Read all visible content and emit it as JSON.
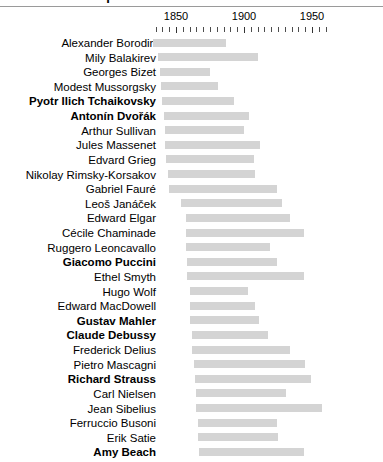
{
  "title": "Composers of the Late Romantic Era",
  "axis": {
    "labels": [
      "1850",
      "1900",
      "1950"
    ],
    "label_years": [
      1850,
      1900,
      1950
    ],
    "tick_step": 5,
    "tick_start": 1835,
    "tick_end": 1960,
    "x_min_year": 1830,
    "x_max_year": 1965,
    "pixels_per_year": 1.36,
    "origin_px": 176
  },
  "colors": {
    "bar": "#d4d4d4",
    "text": "#000000",
    "tick": "#4d4d4d",
    "rule": "#9a9a9a",
    "background": "#ffffff"
  },
  "chart_data": {
    "type": "bar",
    "title": "Composers of the Late Romantic Era",
    "xlabel": "",
    "ylabel": "",
    "xlim": [
      1830,
      1965
    ],
    "grid": false,
    "legend": "none",
    "note": "Horizontal range (Gantt-style) bars: each bar spans the composer's birth year to death year.",
    "categories": [
      "Alexander Borodin",
      "Mily Balakirev",
      "Georges Bizet",
      "Modest Mussorgsky",
      "Pyotr Ilich Tchaikovsky",
      "Antonín Dvořák",
      "Arthur Sullivan",
      "Jules Massenet",
      "Edvard Grieg",
      "Nikolay Rimsky-Korsakov",
      "Gabriel Fauré",
      "Leoš Janáček",
      "Edward Elgar",
      "Cécile Chaminade",
      "Ruggero Leoncavallo",
      "Giacomo Puccini",
      "Ethel Smyth",
      "Hugo Wolf",
      "Edward MacDowell",
      "Gustav Mahler",
      "Claude Debussy",
      "Frederick Delius",
      "Pietro Mascagni",
      "Richard Strauss",
      "Carl Nielsen",
      "Jean Sibelius",
      "Ferruccio Busoni",
      "Erik Satie",
      "Amy Beach"
    ],
    "series": [
      {
        "name": "lifespan",
        "ranges": [
          [
            1833,
            1887
          ],
          [
            1837,
            1910
          ],
          [
            1838,
            1875
          ],
          [
            1839,
            1881
          ],
          [
            1840,
            1893
          ],
          [
            1841,
            1904
          ],
          [
            1842,
            1900
          ],
          [
            1842,
            1912
          ],
          [
            1843,
            1907
          ],
          [
            1844,
            1908
          ],
          [
            1845,
            1924
          ],
          [
            1854,
            1928
          ],
          [
            1857,
            1934
          ],
          [
            1857,
            1944
          ],
          [
            1857,
            1919
          ],
          [
            1858,
            1924
          ],
          [
            1858,
            1944
          ],
          [
            1860,
            1903
          ],
          [
            1860,
            1908
          ],
          [
            1860,
            1911
          ],
          [
            1862,
            1918
          ],
          [
            1862,
            1934
          ],
          [
            1863,
            1945
          ],
          [
            1864,
            1949
          ],
          [
            1865,
            1931
          ],
          [
            1865,
            1957
          ],
          [
            1866,
            1924
          ],
          [
            1866,
            1925
          ],
          [
            1867,
            1944
          ]
        ]
      }
    ]
  },
  "rows": [
    {
      "name": "Alexander Borodin",
      "bold": false,
      "birth": 1833,
      "death": 1887
    },
    {
      "name": "Mily Balakirev",
      "bold": false,
      "birth": 1837,
      "death": 1910
    },
    {
      "name": "Georges Bizet",
      "bold": false,
      "birth": 1838,
      "death": 1875
    },
    {
      "name": "Modest Mussorgsky",
      "bold": false,
      "birth": 1839,
      "death": 1881
    },
    {
      "name": "Pyotr Ilich Tchaikovsky",
      "bold": true,
      "birth": 1840,
      "death": 1893
    },
    {
      "name": "Antonín Dvořák",
      "bold": true,
      "birth": 1841,
      "death": 1904
    },
    {
      "name": "Arthur Sullivan",
      "bold": false,
      "birth": 1842,
      "death": 1900
    },
    {
      "name": "Jules Massenet",
      "bold": false,
      "birth": 1842,
      "death": 1912
    },
    {
      "name": "Edvard Grieg",
      "bold": false,
      "birth": 1843,
      "death": 1907
    },
    {
      "name": "Nikolay Rimsky-Korsakov",
      "bold": false,
      "birth": 1844,
      "death": 1908
    },
    {
      "name": "Gabriel Fauré",
      "bold": false,
      "birth": 1845,
      "death": 1924
    },
    {
      "name": "Leoš Janáček",
      "bold": false,
      "birth": 1854,
      "death": 1928
    },
    {
      "name": "Edward Elgar",
      "bold": false,
      "birth": 1857,
      "death": 1934
    },
    {
      "name": "Cécile Chaminade",
      "bold": false,
      "birth": 1857,
      "death": 1944
    },
    {
      "name": "Ruggero Leoncavallo",
      "bold": false,
      "birth": 1857,
      "death": 1919
    },
    {
      "name": "Giacomo Puccini",
      "bold": true,
      "birth": 1858,
      "death": 1924
    },
    {
      "name": "Ethel Smyth",
      "bold": false,
      "birth": 1858,
      "death": 1944
    },
    {
      "name": "Hugo Wolf",
      "bold": false,
      "birth": 1860,
      "death": 1903
    },
    {
      "name": "Edward MacDowell",
      "bold": false,
      "birth": 1860,
      "death": 1908
    },
    {
      "name": "Gustav Mahler",
      "bold": true,
      "birth": 1860,
      "death": 1911
    },
    {
      "name": "Claude Debussy",
      "bold": true,
      "birth": 1862,
      "death": 1918
    },
    {
      "name": "Frederick Delius",
      "bold": false,
      "birth": 1862,
      "death": 1934
    },
    {
      "name": "Pietro Mascagni",
      "bold": false,
      "birth": 1863,
      "death": 1945
    },
    {
      "name": "Richard Strauss",
      "bold": true,
      "birth": 1864,
      "death": 1949
    },
    {
      "name": "Carl Nielsen",
      "bold": false,
      "birth": 1865,
      "death": 1931
    },
    {
      "name": "Jean Sibelius",
      "bold": false,
      "birth": 1865,
      "death": 1957
    },
    {
      "name": "Ferruccio Busoni",
      "bold": false,
      "birth": 1866,
      "death": 1924
    },
    {
      "name": "Erik Satie",
      "bold": false,
      "birth": 1866,
      "death": 1925
    },
    {
      "name": "Amy Beach",
      "bold": true,
      "birth": 1867,
      "death": 1944
    }
  ]
}
